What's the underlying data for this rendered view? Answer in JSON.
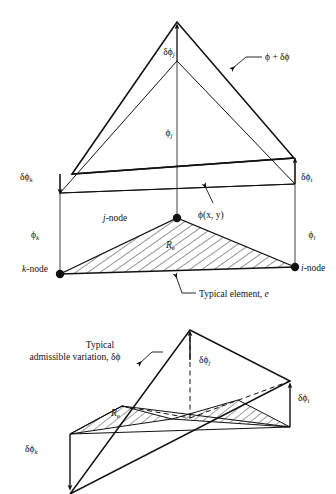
{
  "figure": {
    "ink_color": "#111111",
    "background_color": "#ffffff",
    "hatch_color": "#111111"
  },
  "upper_diagram": {
    "name": "trial-function-and-varied-function",
    "labels": {
      "delta_phi_j": "δϕ",
      "delta_phi_j_sub": "j",
      "phi_plus_delta_phi": "ϕ + δϕ",
      "phi_j": "ϕ",
      "phi_j_sub": "j",
      "delta_phi_k": "δϕ",
      "delta_phi_k_sub": "k",
      "delta_phi_i": "δϕ",
      "delta_phi_i_sub": "i",
      "phi_k": "ϕ",
      "phi_k_sub": "k",
      "phi_i": "ϕ",
      "phi_i_sub": "i",
      "j_node": "-node",
      "j_node_it": "j",
      "k_node": "-node",
      "k_node_it": "k",
      "i_node": "-node",
      "i_node_it": "i",
      "phi_xy": "ϕ(x, y)",
      "region": "R",
      "region_sub": "e",
      "typical_element": "Typical element, ",
      "typical_element_it": "e"
    }
  },
  "lower_diagram": {
    "name": "admissible-variation",
    "labels": {
      "typical_line1": "Typical",
      "typical_line2": "admissible variation, δϕ",
      "delta_phi_j": "δϕ",
      "delta_phi_j_sub": "j",
      "delta_phi_i": "δϕ",
      "delta_phi_i_sub": "i",
      "delta_phi_k": "δϕ",
      "delta_phi_k_sub": "k",
      "region": "R",
      "region_sub": "e"
    }
  }
}
